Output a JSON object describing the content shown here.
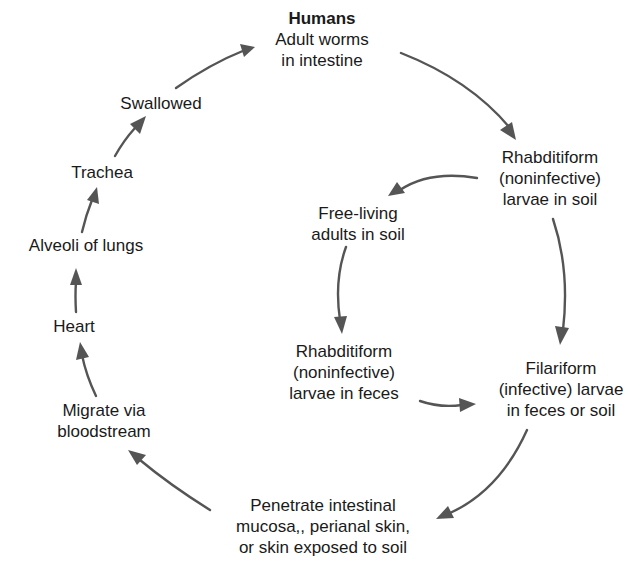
{
  "diagram": {
    "type": "life-cycle",
    "stroke_color": "#555555",
    "text_color": "#1a1a1a",
    "nodes": {
      "humans": {
        "title": "Humans",
        "lines": [
          "Adult worms",
          "in intestine"
        ]
      },
      "rhabditiform_soil": {
        "lines": [
          "Rhabditiform",
          "(noninfective)",
          "larvae in soil"
        ]
      },
      "free_living": {
        "lines": [
          "Free-living",
          "adults in soil"
        ]
      },
      "rhabditiform_feces": {
        "lines": [
          "Rhabditiform",
          "(noninfective)",
          "larvae in feces"
        ]
      },
      "filariform": {
        "lines": [
          "Filariform",
          "(infective) larvae",
          "in feces or soil"
        ]
      },
      "penetrate": {
        "lines": [
          "Penetrate intestinal",
          "mucosa,, perianal skin,",
          "or skin exposed to soil"
        ]
      },
      "migrate": {
        "lines": [
          "Migrate via",
          "bloodstream"
        ]
      },
      "heart": {
        "lines": [
          "Heart"
        ]
      },
      "alveoli": {
        "lines": [
          "Alveoli of lungs"
        ]
      },
      "trachea": {
        "lines": [
          "Trachea"
        ]
      },
      "swallowed": {
        "lines": [
          "Swallowed"
        ]
      }
    },
    "edges": [
      [
        "humans",
        "rhabditiform_soil"
      ],
      [
        "rhabditiform_soil",
        "free_living"
      ],
      [
        "rhabditiform_soil",
        "filariform"
      ],
      [
        "free_living",
        "rhabditiform_feces"
      ],
      [
        "rhabditiform_feces",
        "filariform"
      ],
      [
        "filariform",
        "penetrate"
      ],
      [
        "penetrate",
        "migrate"
      ],
      [
        "migrate",
        "heart"
      ],
      [
        "heart",
        "alveoli"
      ],
      [
        "alveoli",
        "trachea"
      ],
      [
        "trachea",
        "swallowed"
      ],
      [
        "swallowed",
        "humans"
      ]
    ]
  }
}
